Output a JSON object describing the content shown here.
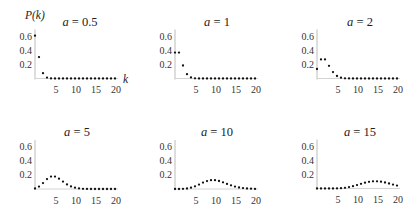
{
  "chart_data": {
    "type": "scatter",
    "title": "",
    "xlabel": "k",
    "ylabel": "P(k)",
    "layout": "2x3 grid of small multiples",
    "xlim": [
      0,
      20
    ],
    "ylim": [
      0,
      0.65
    ],
    "grid": false,
    "legend": "none",
    "xticks": [
      5,
      10,
      15,
      20
    ],
    "xtick_labels": [
      "5",
      "10",
      "15",
      "20"
    ],
    "yticks": [
      0.2,
      0.4,
      0.6
    ],
    "ytick_labels": [
      "0.2",
      "0.4",
      "0.6"
    ],
    "x": [
      0,
      1,
      2,
      3,
      4,
      5,
      6,
      7,
      8,
      9,
      10,
      11,
      12,
      13,
      14,
      15,
      16,
      17,
      18,
      19,
      20
    ],
    "series": [
      {
        "name": "a = 0.5",
        "var": "a",
        "value_text": " = 0.5",
        "a": 0.5,
        "values": [
          0.6065,
          0.3033,
          0.0758,
          0.0126,
          0.0016,
          0.0002,
          0,
          0,
          0,
          0,
          0,
          0,
          0,
          0,
          0,
          0,
          0,
          0,
          0,
          0,
          0
        ]
      },
      {
        "name": "a = 1",
        "var": "a",
        "value_text": " = 1",
        "a": 1,
        "values": [
          0.3679,
          0.3679,
          0.1839,
          0.0613,
          0.0153,
          0.0031,
          0.0005,
          0.0001,
          0,
          0,
          0,
          0,
          0,
          0,
          0,
          0,
          0,
          0,
          0,
          0,
          0
        ]
      },
      {
        "name": "a = 2",
        "var": "a",
        "value_text": " = 2",
        "a": 2,
        "values": [
          0.1353,
          0.2707,
          0.2707,
          0.1804,
          0.0902,
          0.0361,
          0.012,
          0.0034,
          0.0009,
          0.0002,
          0,
          0,
          0,
          0,
          0,
          0,
          0,
          0,
          0,
          0,
          0
        ]
      },
      {
        "name": "a = 5",
        "var": "a",
        "value_text": " = 5",
        "a": 5,
        "values": [
          0.0067,
          0.0337,
          0.0842,
          0.1404,
          0.1755,
          0.1755,
          0.1462,
          0.1044,
          0.0653,
          0.0363,
          0.0181,
          0.0082,
          0.0034,
          0.0013,
          0.0005,
          0.0002,
          0,
          0,
          0,
          0,
          0
        ]
      },
      {
        "name": "a = 10",
        "var": "a",
        "value_text": " = 10",
        "a": 10,
        "values": [
          0.0,
          0.0005,
          0.0023,
          0.0076,
          0.0189,
          0.0378,
          0.0631,
          0.0901,
          0.1126,
          0.1251,
          0.1251,
          0.1137,
          0.0948,
          0.0729,
          0.0521,
          0.0347,
          0.0217,
          0.0128,
          0.0071,
          0.0037,
          0.0019
        ]
      },
      {
        "name": "a = 15",
        "var": "a",
        "value_text": " = 15",
        "a": 15,
        "values": [
          0,
          0,
          0,
          0.0002,
          0.0006,
          0.0019,
          0.0048,
          0.0104,
          0.0194,
          0.0324,
          0.0486,
          0.0663,
          0.0829,
          0.0956,
          0.1024,
          0.1024,
          0.096,
          0.0847,
          0.0706,
          0.0557,
          0.0418
        ]
      }
    ]
  }
}
